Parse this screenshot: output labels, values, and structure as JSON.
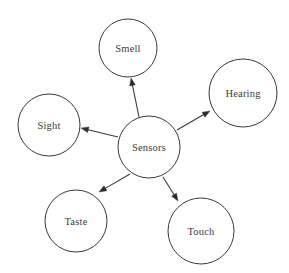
{
  "diagram": {
    "title": "Sensors",
    "type": "radial-node-link-diagram",
    "background_color": "#ffffff",
    "stroke_color": "#3a3a3a",
    "label_color": "#3b3b3b",
    "center": {
      "id": "sensors",
      "label": "Sensors",
      "cx": 149,
      "cy": 147,
      "r": 31
    },
    "nodes": [
      {
        "id": "smell",
        "label": "Smell",
        "cx": 128,
        "cy": 48,
        "r": 29,
        "arrow_from": {
          "x": 139,
          "y": 117
        },
        "arrow_to": {
          "x": 131,
          "y": 78
        }
      },
      {
        "id": "hearing",
        "label": "Hearing",
        "cx": 243,
        "cy": 93,
        "r": 34,
        "arrow_from": {
          "x": 177,
          "y": 130
        },
        "arrow_to": {
          "x": 210,
          "y": 111
        }
      },
      {
        "id": "sight",
        "label": "Sight",
        "cx": 49,
        "cy": 125,
        "r": 31,
        "arrow_from": {
          "x": 118,
          "y": 137
        },
        "arrow_to": {
          "x": 81,
          "y": 128
        }
      },
      {
        "id": "taste",
        "label": "Taste",
        "cx": 76,
        "cy": 221,
        "r": 31,
        "arrow_from": {
          "x": 130,
          "y": 174
        },
        "arrow_to": {
          "x": 99,
          "y": 192
        }
      },
      {
        "id": "touch",
        "label": "Touch",
        "cx": 201,
        "cy": 231,
        "r": 33,
        "arrow_from": {
          "x": 163,
          "y": 177
        },
        "arrow_to": {
          "x": 178,
          "y": 201
        }
      }
    ],
    "edges": [
      {
        "from": "sensors",
        "to": "smell"
      },
      {
        "from": "sensors",
        "to": "hearing"
      },
      {
        "from": "sensors",
        "to": "sight"
      },
      {
        "from": "sensors",
        "to": "taste"
      },
      {
        "from": "sensors",
        "to": "touch"
      }
    ]
  }
}
